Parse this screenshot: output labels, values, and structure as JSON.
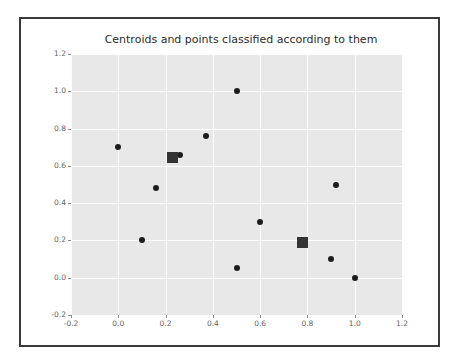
{
  "figure": {
    "title": "Centroids and points classified according to them",
    "border_color": "#3a3a3a",
    "plot_background": "#e8e8e8",
    "grid_color": "#fdfdfd",
    "marker_color": "#1c1c1c",
    "centroid_color": "#333333"
  },
  "axes": {
    "x_ticks": [
      "-0.2",
      "0.0",
      "0.2",
      "0.4",
      "0.6",
      "0.8",
      "1.0",
      "1.2"
    ],
    "y_ticks": [
      "-0.2",
      "0.0",
      "0.2",
      "0.4",
      "0.6",
      "0.8",
      "1.0",
      "1.2"
    ]
  },
  "chart_data": {
    "type": "scatter",
    "title": "Centroids and points classified according to them",
    "xlabel": "",
    "ylabel": "",
    "xlim": [
      -0.2,
      1.2
    ],
    "ylim": [
      -0.2,
      1.2
    ],
    "grid": true,
    "legend": "none",
    "xtick_values": [
      -0.2,
      0.0,
      0.2,
      0.4,
      0.6,
      0.8,
      1.0,
      1.2
    ],
    "ytick_values": [
      -0.2,
      0.0,
      0.2,
      0.4,
      0.6,
      0.8,
      1.0,
      1.2
    ],
    "series": [
      {
        "name": "points",
        "marker": "circle",
        "color": "#1c1c1c",
        "x": [
          0.0,
          0.1,
          0.16,
          0.23,
          0.26,
          0.37,
          0.5,
          0.5,
          0.6,
          0.78,
          0.9,
          0.92,
          1.0
        ],
        "y": [
          0.7,
          0.2,
          0.48,
          0.65,
          0.66,
          0.76,
          1.0,
          0.05,
          0.3,
          0.19,
          0.1,
          0.5,
          0.0
        ]
      },
      {
        "name": "centroids",
        "marker": "square",
        "color": "#333333",
        "x": [
          0.23,
          0.78
        ],
        "y": [
          0.645,
          0.19
        ]
      }
    ]
  }
}
